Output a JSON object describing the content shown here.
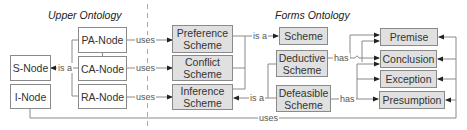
{
  "diagram": {
    "sections": {
      "upper": "Upper Ontology",
      "forms": "Forms Ontology"
    },
    "nodes": {
      "s_node": "S-Node",
      "i_node": "I-Node",
      "pa_node": "PA-Node",
      "ca_node": "CA-Node",
      "ra_node": "RA-Node",
      "preference_scheme": "Preference Scheme",
      "conflict_scheme": "Conflict Scheme",
      "inference_scheme": "Inference Scheme",
      "scheme": "Scheme",
      "deductive_scheme": "Deductive Scheme",
      "defeasible_scheme": "Defeasible Scheme",
      "premise": "Premise",
      "conclusion": "Conclusion",
      "exception": "Exception",
      "presumption": "Presumption"
    },
    "edge_labels": {
      "s_is_a": "is a",
      "pa_uses": "uses",
      "ca_uses": "uses",
      "ra_uses": "uses",
      "scheme_is_a": "is a",
      "inference_is_a": "is a",
      "deductive_has": "has",
      "defeasible_has": "has",
      "bottom_uses": "uses"
    },
    "colors": {
      "shaded_fill": "#e0e0e0",
      "border": "#8a8a8a",
      "line": "#888888"
    }
  }
}
